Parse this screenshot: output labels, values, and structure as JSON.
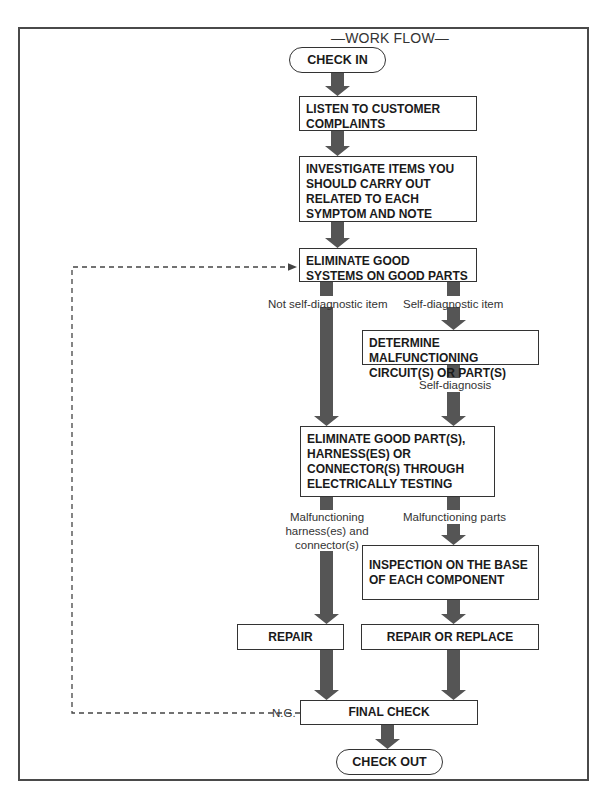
{
  "title": "—WORK FLOW—",
  "nodes": {
    "check_in": "CHECK IN",
    "listen": "LISTEN TO CUSTOMER COMPLAINTS",
    "investigate": "INVESTIGATE ITEMS YOU SHOULD CARRY OUT RELATED TO EACH SYMPTOM AND NOTE",
    "eliminate_systems": "ELIMINATE GOOD SYSTEMS ON GOOD PARTS",
    "determine": "DETERMINE MALFUNCTIONING CIRCUIT(S) OR PART(S)",
    "eliminate_parts": "ELIMINATE GOOD PART(S), HARNESS(ES) OR CONNECTOR(S) THROUGH ELECTRICALLY TESTING",
    "inspection": "INSPECTION ON THE BASE OF EACH COMPONENT",
    "repair": "REPAIR",
    "repair_replace": "REPAIR OR REPLACE",
    "final_check": "FINAL CHECK",
    "check_out": "CHECK OUT"
  },
  "labels": {
    "not_self_diag": "Not self-diagnostic item",
    "self_diag": "Self-diagnostic item",
    "self_diagnosis": "Self-diagnosis",
    "malf_harness_1": "Malfunctioning",
    "malf_harness_2": "harness(es) and",
    "malf_harness_3": "connector(s)",
    "malf_parts": "Malfunctioning parts",
    "ng": "N.G."
  },
  "colors": {
    "arrow": "#555555",
    "border": "#333333",
    "dashed": "#444444"
  }
}
